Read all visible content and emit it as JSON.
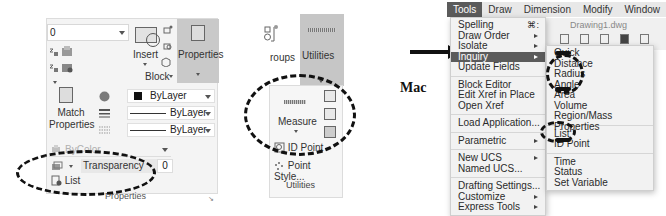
{
  "ribbon_left": {
    "layer_combo_value": "0",
    "insert_label": "Insert",
    "block_group_label": "Block",
    "properties_label": "Properties",
    "match_properties_label_1": "Match",
    "match_properties_label_2": "Properties",
    "color_value": "ByLayer",
    "linetype_value": "ByLayer",
    "lineweight_value": "ByLayer",
    "plotstyle_value": "ByColor",
    "transparency_label": "Transparency",
    "transparency_value": "0",
    "list_label": "List",
    "panel_footer": "Properties"
  },
  "utilities": {
    "groups_label": "roups",
    "utilities_header": "Utilities",
    "measure_label": "Measure",
    "id_point_label": "ID Point",
    "point_style_label": "Point Style...",
    "panel_footer": "Utilities"
  },
  "annotation": {
    "mac_label": "Mac"
  },
  "mac": {
    "menubar": [
      "Tools",
      "Draw",
      "Dimension",
      "Modify",
      "Window",
      "Help"
    ],
    "active_menu": "Tools",
    "document_title": "Drawing1.dwg",
    "tools_menu": {
      "group1": [
        {
          "label": "Spelling",
          "shortcut": "⌘:"
        },
        {
          "label": "Draw Order",
          "submenu": true
        },
        {
          "label": "Isolate",
          "submenu": true
        },
        {
          "label": "Inquiry",
          "submenu": true,
          "highlighted": true
        },
        {
          "label": "Update Fields"
        }
      ],
      "group2": [
        {
          "label": "Block Editor"
        },
        {
          "label": "Edit Xref in Place"
        },
        {
          "label": "Open Xref"
        }
      ],
      "group3": [
        {
          "label": "Load Application..."
        }
      ],
      "group4": [
        {
          "label": "Parametric",
          "submenu": true
        }
      ],
      "group5": [
        {
          "label": "New UCS",
          "submenu": true
        },
        {
          "label": "Named UCS..."
        }
      ],
      "group6": [
        {
          "label": "Drafting Settings..."
        },
        {
          "label": "Customize",
          "submenu": true
        },
        {
          "label": "Express Tools",
          "submenu": true
        }
      ]
    },
    "inquiry_submenu": {
      "group1": [
        "Quick",
        "Distance",
        "Radius",
        "Angle",
        "Area",
        "Volume",
        "Region/Mass Properties"
      ],
      "group2": [
        "List",
        "ID Point"
      ],
      "group3": [
        "Time",
        "Status",
        "Set Variable"
      ]
    }
  },
  "colors": {
    "menu_highlight": "#5b5b5b",
    "ribbon_bg": "#f4f4f4",
    "ribbon_active": "#c6c6c6"
  }
}
